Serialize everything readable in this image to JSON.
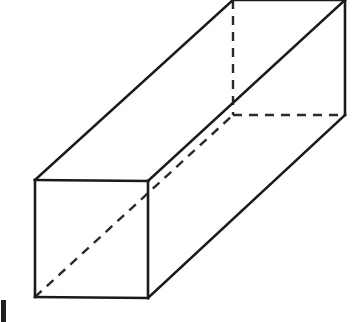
{
  "figure": {
    "background_color": "#ffffff",
    "solid_line_color": "#1a1a1a",
    "hidden_line_color": "#2a2a2a",
    "solid_line_width": 2.6,
    "hidden_line_width": 2.4,
    "hidden_dash_pattern": "9 7",
    "canvas": {
      "width": 356,
      "height": 322
    },
    "projection": "oblique",
    "shape_type": "rectangular-prism",
    "vertices": {
      "front_top_left": [
        35,
        180
      ],
      "front_top_right": [
        148,
        181
      ],
      "front_bottom_right": [
        148,
        298
      ],
      "front_bottom_left": [
        35,
        297
      ],
      "back_top_left": [
        233,
        0
      ],
      "back_top_right": [
        345,
        0
      ],
      "back_bottom_right": [
        345,
        115
      ],
      "back_bottom_left": [
        233,
        115
      ]
    },
    "edges_solid": [
      {
        "name": "front-face-top",
        "from": "front_top_left",
        "to": "front_top_right"
      },
      {
        "name": "front-face-right",
        "from": "front_top_right",
        "to": "front_bottom_right"
      },
      {
        "name": "front-face-bottom",
        "from": "front_bottom_right",
        "to": "front_bottom_left"
      },
      {
        "name": "front-face-left",
        "from": "front_bottom_left",
        "to": "front_top_left"
      },
      {
        "name": "depth-top-left",
        "from": "front_top_left",
        "to": "back_top_left"
      },
      {
        "name": "depth-top-right",
        "from": "front_top_right",
        "to": "back_top_right"
      },
      {
        "name": "depth-bottom-right",
        "from": "front_bottom_right",
        "to": "back_bottom_right"
      },
      {
        "name": "back-face-top",
        "from": "back_top_left",
        "to": "back_top_right"
      },
      {
        "name": "back-face-right",
        "from": "back_top_right",
        "to": "back_bottom_right"
      }
    ],
    "edges_hidden": [
      {
        "name": "back-face-left",
        "from": "back_top_left",
        "to": "back_bottom_left"
      },
      {
        "name": "back-face-bottom",
        "from": "back_bottom_left",
        "to": "back_bottom_right"
      },
      {
        "name": "depth-bottom-left",
        "from": "front_bottom_left",
        "to": "back_bottom_left"
      }
    ],
    "margin_mark": {
      "name": "cropped-caption-stub",
      "visible": true,
      "position": [
        1,
        300
      ]
    }
  }
}
